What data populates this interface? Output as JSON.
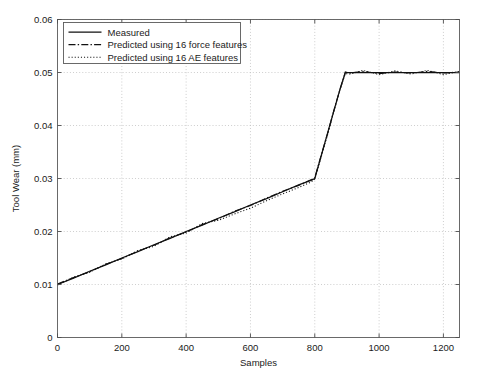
{
  "chart_data": {
    "type": "line",
    "title": "",
    "xlabel": "Samples",
    "ylabel": "Tool Wear (mm)",
    "xlim": [
      0,
      1250
    ],
    "ylim": [
      0,
      0.06
    ],
    "xticks": [
      0,
      200,
      400,
      600,
      800,
      1000,
      1200
    ],
    "xticklabels": [
      "0",
      "200",
      "400",
      "600",
      "800",
      "1000",
      "1200"
    ],
    "yticks": [
      0,
      0.01,
      0.02,
      0.03,
      0.04,
      0.05,
      0.06
    ],
    "yticklabels": [
      "0",
      "0.01",
      "0.02",
      "0.03",
      "0.04",
      "0.05",
      "0.06"
    ],
    "grid": true,
    "grid_style": "dotted",
    "legend_position": "upper-left",
    "series": [
      {
        "name": "Measured",
        "style": "solid",
        "color": "#111111",
        "x": [
          0,
          50,
          100,
          150,
          200,
          250,
          300,
          350,
          400,
          450,
          500,
          550,
          600,
          650,
          700,
          750,
          790,
          800,
          820,
          840,
          860,
          880,
          895,
          910,
          950,
          1000,
          1050,
          1100,
          1150,
          1200,
          1250
        ],
        "y": [
          0.01,
          0.0112,
          0.0125,
          0.0137,
          0.015,
          0.0162,
          0.0175,
          0.0187,
          0.02,
          0.0212,
          0.0225,
          0.0237,
          0.025,
          0.0262,
          0.0275,
          0.0288,
          0.0297,
          0.03,
          0.0343,
          0.0386,
          0.0429,
          0.0472,
          0.05,
          0.05,
          0.05,
          0.05,
          0.05,
          0.05,
          0.05,
          0.05,
          0.05
        ]
      },
      {
        "name": "Predicted using 16 force features",
        "style": "dash-dot",
        "color": "#111111",
        "x": [
          0,
          50,
          100,
          150,
          200,
          250,
          300,
          350,
          400,
          450,
          500,
          550,
          600,
          650,
          700,
          750,
          790,
          800,
          820,
          840,
          860,
          880,
          895,
          910,
          950,
          1000,
          1050,
          1100,
          1150,
          1200,
          1250
        ],
        "y": [
          0.0101,
          0.0113,
          0.0124,
          0.0138,
          0.0149,
          0.0163,
          0.0174,
          0.0188,
          0.0199,
          0.0213,
          0.0224,
          0.0238,
          0.0249,
          0.0263,
          0.0276,
          0.0287,
          0.0298,
          0.0301,
          0.0344,
          0.0385,
          0.043,
          0.0471,
          0.0501,
          0.0499,
          0.0502,
          0.0498,
          0.0501,
          0.0499,
          0.0502,
          0.0499,
          0.0501
        ]
      },
      {
        "name": "Predicted using 16 AE features",
        "style": "dotted",
        "color": "#111111",
        "x": [
          0,
          50,
          100,
          150,
          200,
          250,
          300,
          350,
          400,
          450,
          500,
          550,
          600,
          650,
          700,
          750,
          790,
          800,
          820,
          840,
          860,
          880,
          895,
          910,
          950,
          1000,
          1050,
          1100,
          1150,
          1200,
          1250
        ],
        "y": [
          0.0099,
          0.0114,
          0.0123,
          0.0139,
          0.0148,
          0.0164,
          0.0172,
          0.019,
          0.0197,
          0.0215,
          0.0221,
          0.0233,
          0.0244,
          0.0258,
          0.0271,
          0.0283,
          0.0294,
          0.0299,
          0.0341,
          0.0383,
          0.0428,
          0.047,
          0.0498,
          0.0497,
          0.0504,
          0.0496,
          0.0503,
          0.0497,
          0.0504,
          0.0496,
          0.0502
        ]
      }
    ]
  }
}
